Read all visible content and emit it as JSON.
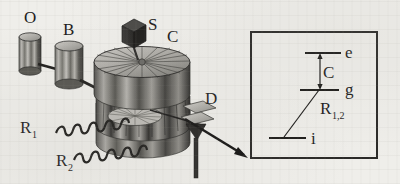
{
  "figure": {
    "background_color": "#efeeea",
    "ink_color": "#1c1c1c"
  },
  "apparatus": {
    "labels": {
      "oven": "O",
      "box": "B",
      "source": "S",
      "cavity": "C",
      "detector": "D",
      "ramsey_one": "R",
      "ramsey_one_sub": "1",
      "ramsey_two": "R",
      "ramsey_two_sub": "2"
    },
    "components": [
      {
        "name": "oven-cylinder",
        "label": "O"
      },
      {
        "name": "box-cylinder",
        "label": "B"
      },
      {
        "name": "source-cube",
        "label": "S"
      },
      {
        "name": "cavity-assembly",
        "label": "C"
      },
      {
        "name": "detector-plates",
        "label": "D"
      },
      {
        "name": "ramsey-zone-1",
        "label": "R1"
      },
      {
        "name": "ramsey-zone-2",
        "label": "R2"
      }
    ]
  },
  "inset": {
    "name": "energy-level-diagram",
    "levels": [
      {
        "id": "e",
        "label": "e",
        "y": 53,
        "x1": 305,
        "x2": 341
      },
      {
        "id": "g",
        "label": "g",
        "y": 90,
        "x1": 300,
        "x2": 339
      },
      {
        "id": "i",
        "label": "i",
        "y": 138,
        "x1": 269,
        "x2": 306
      }
    ],
    "transitions": [
      {
        "id": "C",
        "label": "C",
        "label_sub": "",
        "from": "g",
        "to": "e",
        "type": "double-arrow"
      },
      {
        "id": "R12",
        "label": "R",
        "label_sub": "1,2",
        "from": "i",
        "to": "g",
        "type": "line"
      }
    ],
    "box": {
      "x": 251,
      "y": 32,
      "width": 126,
      "height": 126
    }
  },
  "colors": {
    "ink": "#1c1c1c",
    "metal_light": "#d2d0cb",
    "metal_mid": "#9b9a95",
    "metal_dark": "#4a4a48",
    "metal_darkest": "#2b2b29",
    "paper": "#efeeea"
  }
}
